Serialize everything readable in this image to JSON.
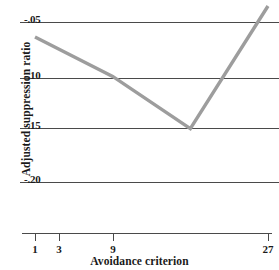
{
  "chart_data": {
    "type": "line",
    "title": "",
    "xlabel": "Avoidance criterion",
    "ylabel": "Adjusted suppression ratio",
    "x_scale": "log",
    "x": [
      1,
      3,
      9,
      27
    ],
    "x_tick_labels": [
      "1",
      "3",
      "9",
      "27"
    ],
    "y_tick_labels": [
      "-.05",
      "-.10",
      "-.15",
      "-.20"
    ],
    "y_tick_values": [
      -0.05,
      -0.1,
      -0.15,
      -0.2
    ],
    "ylim": [
      -0.215,
      -0.032
    ],
    "grid": "horizontal",
    "legend": "none",
    "series": [
      {
        "name": "Adjusted suppression ratio",
        "values": [
          -0.064,
          -0.101,
          -0.15,
          -0.035
        ],
        "color": "#9d9d9d"
      }
    ],
    "axis_color": "#4a4a4a",
    "grid_color": "#4a4a4a",
    "background": "#ffffff"
  },
  "axes": {
    "y_ticks": [
      {
        "label": "-.05",
        "y_px": 22
      },
      {
        "label": "-.10",
        "y_px": 78
      },
      {
        "label": "-.15",
        "y_px": 128
      },
      {
        "label": "-.20",
        "y_px": 182
      }
    ],
    "x_ticks": [
      {
        "label": "1",
        "x_px": 35
      },
      {
        "label": "3",
        "x_px": 59
      },
      {
        "label": "9",
        "x_px": 113
      },
      {
        "label": "27",
        "x_px": 268
      }
    ]
  }
}
